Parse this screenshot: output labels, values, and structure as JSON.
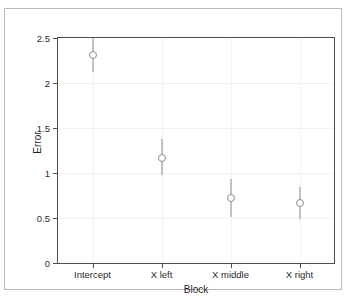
{
  "chart_data": {
    "type": "scatter",
    "title": "",
    "xlabel": "Block",
    "ylabel": "Error",
    "categories": [
      "Intercept",
      "X left",
      "X middle",
      "X right"
    ],
    "values": [
      2.31,
      1.17,
      0.72,
      0.67
    ],
    "errors_low": [
      2.12,
      0.98,
      0.51,
      0.49
    ],
    "errors_high": [
      2.52,
      1.38,
      0.93,
      0.85
    ],
    "ylim": [
      0,
      2.5
    ],
    "yticks": [
      0,
      0.5,
      1,
      1.5,
      2,
      2.5
    ],
    "ytick_labels": [
      "0",
      "0.5",
      "1",
      "1.5",
      "2",
      "2.5"
    ],
    "xtick_labels": [
      "Intercept",
      "X left",
      "X middle",
      "X right"
    ],
    "grid": true,
    "legend": "none",
    "marker": "open-circle",
    "series": [
      {
        "name": "Error",
        "points": [
          {
            "category": "Intercept",
            "value": 2.31,
            "low": 2.12,
            "high": 2.52
          },
          {
            "category": "X left",
            "value": 1.17,
            "low": 0.98,
            "high": 1.38
          },
          {
            "category": "X middle",
            "value": 0.72,
            "low": 0.51,
            "high": 0.93
          },
          {
            "category": "X right",
            "value": 0.67,
            "low": 0.49,
            "high": 0.85
          }
        ]
      }
    ],
    "colors": {
      "marker": "#8a8a9c",
      "errorbar": "#8a8a9c",
      "axis": "#4d4d4d",
      "grid": "#f2f2f2",
      "frame": "#b9b9b9",
      "text": "#2b2b2b"
    }
  }
}
